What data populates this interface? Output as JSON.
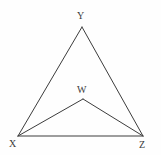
{
  "figure": {
    "kind": "geometry-diagram",
    "width": 161,
    "height": 155,
    "background_color": "#fefefe",
    "stroke_color": "#3c3c3c",
    "stroke_width": 1,
    "label_color": "#3a3a3a",
    "label_font_size": 10
  },
  "points": {
    "Y": {
      "label": "Y",
      "x": 82,
      "y": 27
    },
    "X": {
      "label": "X",
      "x": 18,
      "y": 136
    },
    "Z": {
      "label": "Z",
      "x": 143,
      "y": 136
    },
    "W": {
      "label": "W",
      "x": 83,
      "y": 99
    }
  },
  "labels": {
    "Y": "Y",
    "X": "X",
    "Z": "Z",
    "W": "W"
  },
  "segments": [
    {
      "name": "XY",
      "from": "X",
      "to": "Y"
    },
    {
      "name": "YZ",
      "from": "Y",
      "to": "Z"
    },
    {
      "name": "XZ",
      "from": "X",
      "to": "Z"
    },
    {
      "name": "XW",
      "from": "X",
      "to": "W"
    },
    {
      "name": "WZ",
      "from": "W",
      "to": "Z"
    }
  ]
}
